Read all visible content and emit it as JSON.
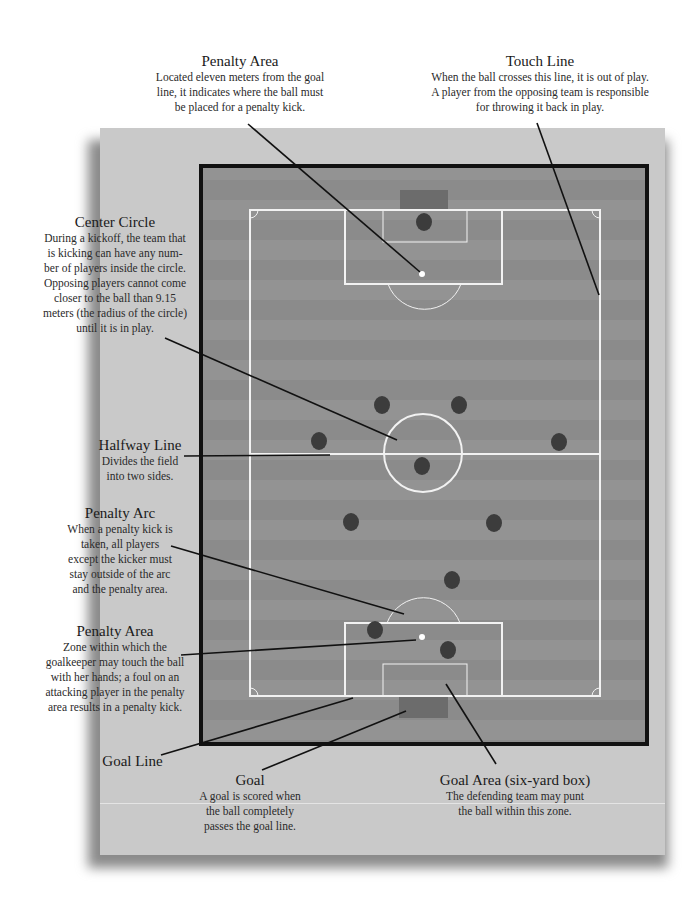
{
  "colors": {
    "panel": "#c9c9c9",
    "field": "#8e8e8e",
    "field_stripe": "#969696",
    "border": "#111111",
    "lines": "#f0f0f0",
    "goal": "#6e6e6e",
    "player": "#3c3c3c",
    "ball": "#ffffff",
    "leader": "#111111"
  },
  "labels": {
    "penalty_area_top": {
      "title": "Penalty Area",
      "lines": [
        "Located eleven meters from the goal",
        "line, it indicates where the ball must",
        "be placed for a penalty kick."
      ]
    },
    "touch_line": {
      "title": "Touch Line",
      "lines": [
        "When the ball crosses this line, it is out of play.",
        "A player from the opposing team is responsible",
        "for throwing it back in play."
      ]
    },
    "center_circle": {
      "title": "Center Circle",
      "lines": [
        "During a kickoff, the team that",
        "is kicking can have any num-",
        "ber of players inside the circle.",
        "Opposing players cannot come",
        "closer to the ball than 9.15",
        "meters (the radius of the circle)",
        "until it is in play."
      ]
    },
    "halfway_line": {
      "title": "Halfway Line",
      "lines": [
        "Divides the field",
        "into two sides."
      ]
    },
    "penalty_arc": {
      "title": "Penalty Arc",
      "lines": [
        "When a penalty kick is",
        "taken, all players",
        "except the kicker must",
        "stay outside of the arc",
        "and the penalty area."
      ]
    },
    "penalty_area_bottom": {
      "title": "Penalty Area",
      "lines": [
        "Zone within which the",
        "goalkeeper may touch the ball",
        "with her hands; a foul on an",
        "attacking player in the penalty",
        "area results in a penalty kick."
      ]
    },
    "goal_line": {
      "title": "Goal Line",
      "lines": []
    },
    "goal": {
      "title": "Goal",
      "lines": [
        "A goal is scored when",
        "the ball completely",
        "passes the goal line."
      ]
    },
    "goal_area": {
      "title": "Goal Area (six-yard box)",
      "lines": [
        "The defending team may punt",
        "the ball within this zone."
      ]
    }
  },
  "players": [
    {
      "x": 424,
      "y": 222
    },
    {
      "x": 382,
      "y": 405
    },
    {
      "x": 459,
      "y": 405
    },
    {
      "x": 319,
      "y": 441
    },
    {
      "x": 559,
      "y": 442
    },
    {
      "x": 422,
      "y": 466
    },
    {
      "x": 351,
      "y": 522
    },
    {
      "x": 494,
      "y": 523
    },
    {
      "x": 452,
      "y": 580
    },
    {
      "x": 375,
      "y": 630
    },
    {
      "x": 448,
      "y": 650
    }
  ],
  "balls": [
    {
      "x": 422,
      "y": 274
    },
    {
      "x": 422,
      "y": 637
    }
  ]
}
